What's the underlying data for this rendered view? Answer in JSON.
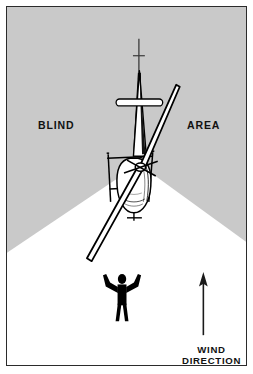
{
  "figure": {
    "frame_border_color": "#2b2b2b",
    "background_color": "#ffffff"
  },
  "scene": {
    "blind_area_color": "#c9c9c9",
    "visible_cone_color": "#ffffff",
    "ink_color": "#000000",
    "blind_area_label_left": "BLIND",
    "blind_area_label_right": "AREA",
    "cone_apex": {
      "x": 133,
      "y": 160
    },
    "cone_left_edge_end": {
      "x": 0,
      "y": 245
    },
    "cone_right_edge_end": {
      "x": 241,
      "y": 235
    }
  },
  "labels": {
    "blind": "BLIND",
    "area": "AREA",
    "wind_line_1": "WIND",
    "wind_line_2": "DIRECTION"
  },
  "helicopter": {
    "name": "helicopter-top-view",
    "fuselage_fill": "#ffffff",
    "rotor_blade_fill": "#ffffff",
    "shadow_fill": "#000000",
    "tail_rotor_present": true,
    "skids_present": true,
    "main_rotor_blades": 2
  },
  "ground_person": {
    "name": "signalman-silhouette",
    "fill": "#000000",
    "pose": "arms-raised",
    "position": {
      "x": 116,
      "y": 295
    }
  },
  "wind_arrow": {
    "name": "wind-direction-arrow",
    "direction": "up",
    "color": "#1a1a1a",
    "tail": {
      "x": 198,
      "y": 330
    },
    "head": {
      "x": 198,
      "y": 272
    }
  }
}
